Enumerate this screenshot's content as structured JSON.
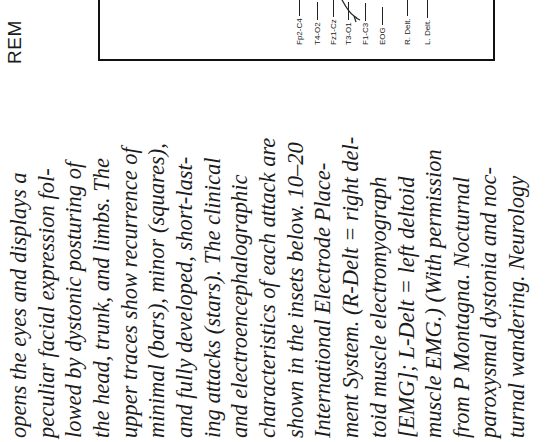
{
  "header": {
    "label": "REM"
  },
  "figure": {
    "trace_labels": [
      "Fp2-C4",
      "T4-O2",
      "Fz1-Cz",
      "T3-O1",
      "F1-C3",
      "EOG",
      "R. Delt.",
      "L. Delt."
    ]
  },
  "caption": {
    "lines": [
      "opens the eyes and displays a",
      "peculiar facial expression fol-",
      "lowed by dystonic posturing of",
      "the head, trunk, and limbs. The",
      "upper traces show recurrence of",
      "minimal (bars), minor (squares),",
      "and fully developed, short-last-",
      "ing attacks (stars). The clinical",
      "and electroencephalographic",
      "characteristics of each attack are",
      "shown in the insets below. 10–20",
      "International Electrode Place-",
      "ment System. (R-Delt = right del-",
      "toid muscle electromyograph",
      "[EMG]; L-Delt = left deltoid",
      "muscle EMG.) (With permission",
      "from P Montagna. Nocturnal",
      "paroxysmal dystonia and noc-",
      "turnal wandering. Neurology"
    ]
  }
}
